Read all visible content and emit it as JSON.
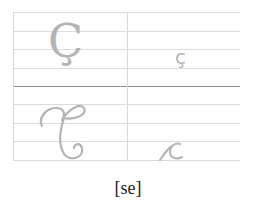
{
  "cells": {
    "upper_print": "Ç",
    "lower_print": "ç",
    "upper_cursive_name": "cursive-capital-c-cedilla",
    "lower_cursive_name": "cursive-small-c"
  },
  "label": "[se]",
  "colors": {
    "glyph": "#b4b4b4",
    "guide_line": "#dcdcdc",
    "center_line": "#8e8e8e",
    "label_text": "#222222"
  }
}
